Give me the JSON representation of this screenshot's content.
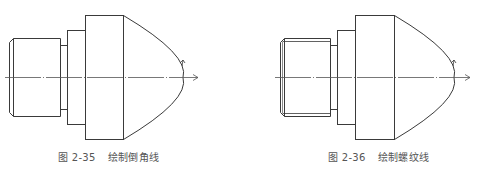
{
  "figures": [
    {
      "id": "2-35",
      "label": "图 2-35",
      "title": "绘制倒角线",
      "features": [
        "chamfer-lines"
      ]
    },
    {
      "id": "2-36",
      "label": "图 2-36",
      "title": "绘制螺纹线",
      "features": [
        "chamfer-lines",
        "thread-lines"
      ]
    }
  ],
  "colors": {
    "line": "#3a3a3a",
    "centerline": "#555555",
    "caption": "#555555",
    "background": "#ffffff"
  }
}
